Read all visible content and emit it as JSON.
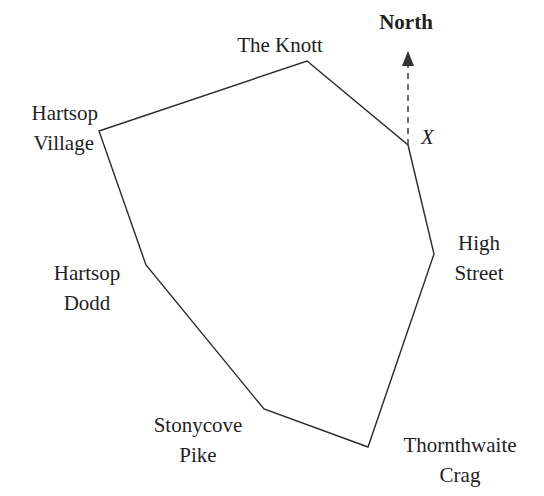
{
  "diagram": {
    "type": "route-map",
    "line_color": "#2a2a2a",
    "text_color": "#1f1f1f",
    "north": {
      "label": "North",
      "from": [
        408,
        145
      ],
      "to": [
        408,
        54
      ]
    },
    "vertex_x_label": "X",
    "vertices": [
      {
        "name": "the-knott",
        "x": 307,
        "y": 61
      },
      {
        "name": "x-point",
        "x": 408,
        "y": 145
      },
      {
        "name": "high-street",
        "x": 434,
        "y": 254
      },
      {
        "name": "thornthwaite-crag",
        "x": 368,
        "y": 447
      },
      {
        "name": "stonycove-pike",
        "x": 264,
        "y": 409
      },
      {
        "name": "hartsop-dodd",
        "x": 146,
        "y": 265
      },
      {
        "name": "hartsop-village",
        "x": 99,
        "y": 131
      }
    ],
    "labels": {
      "the_knott": [
        "The Knott"
      ],
      "hartsop_village": [
        "Hartsop",
        "Village"
      ],
      "hartsop_dodd": [
        "Hartsop",
        "Dodd"
      ],
      "stonycove_pike": [
        "Stonycove",
        "Pike"
      ],
      "thornthwaite_crag": [
        "Thornthwaite",
        "Crag"
      ],
      "high_street": [
        "High",
        "Street"
      ]
    }
  }
}
